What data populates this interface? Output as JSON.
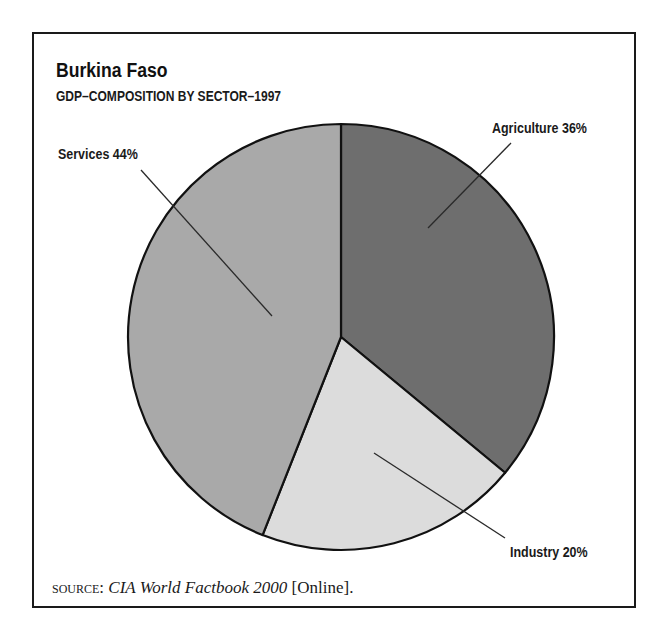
{
  "header": {
    "title": "Burkina Faso",
    "subtitle": "GDP–COMPOSITION BY SECTOR–1997"
  },
  "labels": {
    "agriculture": "Agriculture 36%",
    "industry": "Industry 20%",
    "services": "Services 44%"
  },
  "source": {
    "prefix": "SOURCE:",
    "title": "CIA World Factbook 2000",
    "suffix": "[Online]."
  },
  "colors": {
    "agriculture": "#6e6e6e",
    "industry": "#dcdcdc",
    "services": "#a9a9a9",
    "outline": "#111111"
  },
  "chart_data": {
    "type": "pie",
    "title": "Burkina Faso",
    "subtitle": "GDP–COMPOSITION BY SECTOR–1997",
    "categories": [
      "Agriculture",
      "Industry",
      "Services"
    ],
    "values": [
      36,
      20,
      44
    ],
    "unit": "%",
    "labels": [
      "Agriculture 36%",
      "Industry 20%",
      "Services 44%"
    ],
    "start_angle": "12 o'clock, clockwise",
    "legend": "none (leader-line labels)",
    "source": "SOURCE: CIA World Factbook 2000 [Online]."
  }
}
